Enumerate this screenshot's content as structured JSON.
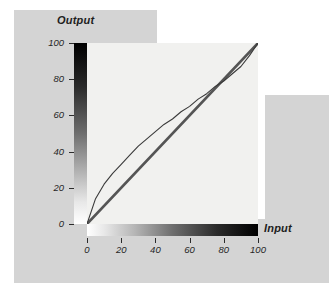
{
  "figure": {
    "title": "",
    "axis_titles": {
      "y": "Output",
      "x": "Input"
    },
    "colors": {
      "page_background": "#ffffff",
      "panel_background": "#d4d4d4",
      "plot_background": "#f1f1ef",
      "curve_color": "#3a3a3a",
      "identity_line_color": "#555555",
      "text_color": "#1d1d1d"
    },
    "ramps": {
      "vertical": {
        "name": "output-gradient-ramp",
        "from": "#000000",
        "to": "#ffffff",
        "direction": "top-to-bottom"
      },
      "horizontal": {
        "name": "input-gradient-ramp",
        "from": "#ffffff",
        "to": "#000000",
        "direction": "left-to-right"
      }
    }
  },
  "chart_data": {
    "type": "line",
    "title": "",
    "subtitle": "",
    "xlabel": "Input",
    "ylabel": "Output",
    "xlim": [
      0,
      100
    ],
    "ylim": [
      0,
      100
    ],
    "grid": false,
    "legend": null,
    "xticks": [
      0,
      20,
      40,
      60,
      80,
      100
    ],
    "xtick_labels": [
      "0",
      "20",
      "40",
      "60",
      "80",
      "100"
    ],
    "yticks": [
      0,
      20,
      40,
      60,
      80,
      100
    ],
    "ytick_labels": [
      "0",
      "20",
      "40",
      "60",
      "80",
      "100"
    ],
    "series": [
      {
        "name": "gamma-curve",
        "style": "thin-line",
        "x": [
          0,
          5,
          10,
          15,
          20,
          25,
          30,
          35,
          40,
          45,
          50,
          55,
          60,
          65,
          70,
          75,
          80,
          85,
          90,
          95,
          100
        ],
        "values": [
          0,
          14,
          22,
          28,
          33,
          38,
          43,
          47,
          51,
          55,
          58,
          62,
          65,
          69,
          72,
          76,
          79,
          83,
          87,
          93,
          100
        ]
      },
      {
        "name": "identity-line",
        "style": "thick-line",
        "x": [
          0,
          100
        ],
        "values": [
          0,
          100
        ]
      }
    ]
  }
}
